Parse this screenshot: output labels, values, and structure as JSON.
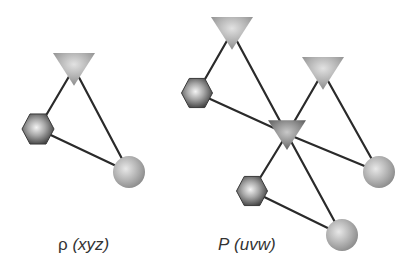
{
  "colors": {
    "background": "#ffffff",
    "edge": "#2a2a2a",
    "label": "#333333"
  },
  "diagrams": [
    {
      "id": "left",
      "label_symbol": "ρ",
      "label_args": "(xyz)",
      "label_x": 58,
      "label_y": 250,
      "nodes": [
        {
          "id": "t1",
          "shape": "triangle",
          "x": 74,
          "y": 68,
          "size": 42,
          "shade": "light"
        },
        {
          "id": "h1",
          "shape": "hexagon",
          "x": 38,
          "y": 129,
          "size": 32
        },
        {
          "id": "c1",
          "shape": "circle",
          "x": 129,
          "y": 172,
          "r": 16
        }
      ],
      "edges": [
        [
          "t1",
          "h1"
        ],
        [
          "t1",
          "c1"
        ],
        [
          "h1",
          "c1"
        ]
      ]
    },
    {
      "id": "right",
      "label_symbol": "P",
      "label_args": "(uvw)",
      "label_x": 218,
      "label_y": 250,
      "nodes": [
        {
          "id": "t1",
          "shape": "triangle",
          "x": 232,
          "y": 32,
          "size": 42,
          "shade": "light"
        },
        {
          "id": "t2",
          "shape": "triangle",
          "x": 323,
          "y": 72,
          "size": 42,
          "shade": "light"
        },
        {
          "id": "tc",
          "shape": "triangle",
          "x": 287,
          "y": 134,
          "size": 38,
          "shade": "dark"
        },
        {
          "id": "h1",
          "shape": "hexagon",
          "x": 197,
          "y": 93,
          "size": 31
        },
        {
          "id": "h2",
          "shape": "hexagon",
          "x": 252,
          "y": 191,
          "size": 31
        },
        {
          "id": "c1",
          "shape": "circle",
          "x": 379,
          "y": 172,
          "r": 16
        },
        {
          "id": "c2",
          "shape": "circle",
          "x": 342,
          "y": 235,
          "r": 16
        }
      ],
      "edges": [
        [
          "t1",
          "h1"
        ],
        [
          "t1",
          "tc"
        ],
        [
          "h1",
          "tc"
        ],
        [
          "t2",
          "tc"
        ],
        [
          "t2",
          "c1"
        ],
        [
          "tc",
          "c1"
        ],
        [
          "tc",
          "h2"
        ],
        [
          "tc",
          "c2"
        ],
        [
          "h2",
          "c2"
        ]
      ]
    }
  ],
  "labels": {
    "left": {
      "symbol": "ρ",
      "args": "(xyz)"
    },
    "right": {
      "symbol": "P",
      "args": "(uvw)"
    }
  }
}
